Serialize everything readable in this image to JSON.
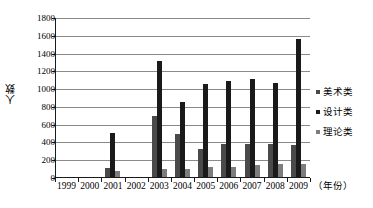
{
  "chart_data": {
    "type": "bar",
    "title": "",
    "xlabel": "（年份）",
    "ylabel": "人数",
    "ylim": [
      0,
      1800
    ],
    "ytick_step": 200,
    "yticks": [
      0,
      200,
      400,
      600,
      800,
      1000,
      1200,
      1400,
      1600,
      1800
    ],
    "ytick_labels": [
      "0",
      "200",
      "400",
      "600",
      "800",
      "1000",
      "1200",
      "1400",
      "1600",
      "1800"
    ],
    "categories": [
      "1999",
      "2000",
      "2001",
      "2002",
      "2003",
      "2004",
      "2005",
      "2006",
      "2007",
      "2008",
      "2009"
    ],
    "grid": true,
    "legend_position": "right",
    "series": [
      {
        "name": "美术类",
        "color": "#4a4a4a",
        "values": [
          0,
          0,
          100,
          0,
          690,
          480,
          320,
          370,
          375,
          370,
          365
        ]
      },
      {
        "name": "设计类",
        "color": "#1a1a1a",
        "values": [
          0,
          0,
          490,
          0,
          1310,
          845,
          1045,
          1075,
          1100,
          1060,
          1550
        ]
      },
      {
        "name": "理论类",
        "color": "#7d7d7d",
        "values": [
          0,
          0,
          65,
          0,
          95,
          85,
          110,
          115,
          140,
          145,
          150
        ]
      }
    ]
  },
  "axis": {
    "yaxis_title": "人数",
    "xaxis_title": "（年份）"
  },
  "colors": {
    "grid": "#8a8a8a",
    "axis": "#1a1a1a",
    "background": "#ffffff"
  }
}
